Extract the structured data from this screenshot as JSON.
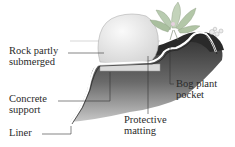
{
  "diagram": {
    "type": "pond cross-section illustration",
    "labels": {
      "rock": [
        "Rock partly",
        "submerged"
      ],
      "concrete": [
        "Concrete",
        "support"
      ],
      "liner": [
        "Liner"
      ],
      "matting": [
        "Protective",
        "matting"
      ],
      "bog": [
        "Bog plant",
        "pocket"
      ]
    },
    "colors": {
      "soil_dark": "#3a3a3a",
      "soil_mid": "#7a7a7a",
      "rock": "#e8e8e8",
      "liner": "#ffffff",
      "concrete": "#d9d9d9",
      "plant": "#b5c9a8",
      "flower": "#d9b3c9",
      "leader": "#333333",
      "text": "#2a2a2a"
    }
  }
}
